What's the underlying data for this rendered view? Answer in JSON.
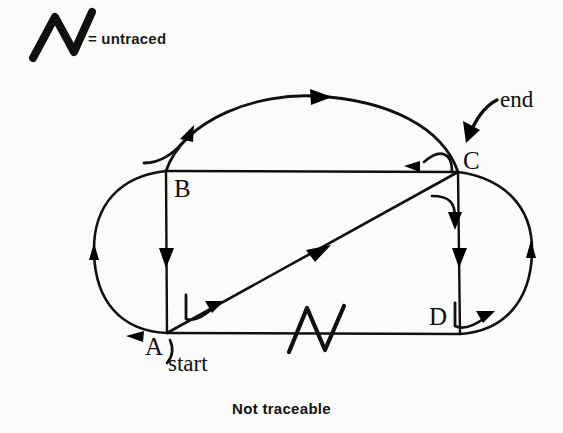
{
  "legend": {
    "symbol_name": "zigzag-untraced-mark",
    "equals_sign": "=",
    "text": "= untraced"
  },
  "caption": {
    "text": "Not traceable"
  },
  "diagram": {
    "vertices": [
      {
        "id": "A",
        "label": "A",
        "x": 167,
        "y": 333,
        "role": "start"
      },
      {
        "id": "B",
        "label": "B",
        "x": 166,
        "y": 171,
        "role": "corner"
      },
      {
        "id": "C",
        "label": "C",
        "x": 458,
        "y": 172,
        "role": "end"
      },
      {
        "id": "D",
        "label": "D",
        "x": 460,
        "y": 334,
        "role": "corner"
      }
    ],
    "annotations": [
      {
        "id": "start",
        "text": "start",
        "points_to": "A"
      },
      {
        "id": "end",
        "text": "end",
        "points_to": "C"
      }
    ],
    "edges": [
      {
        "id": "BC",
        "from": "B",
        "to": "C",
        "kind": "straight",
        "direction": "C-to-B",
        "traced": true
      },
      {
        "id": "BA",
        "from": "B",
        "to": "A",
        "kind": "straight",
        "direction": "B-to-A",
        "traced": true
      },
      {
        "id": "CD",
        "from": "C",
        "to": "D",
        "kind": "straight",
        "direction": "C-to-D",
        "traced": true
      },
      {
        "id": "AD",
        "from": "A",
        "to": "D",
        "kind": "straight",
        "direction": "none",
        "traced": false
      },
      {
        "id": "AC",
        "from": "A",
        "to": "C",
        "kind": "diagonal",
        "direction": "A-to-C",
        "traced": true
      },
      {
        "id": "B-arc-C",
        "from": "B",
        "to": "C",
        "kind": "outer-arc-top",
        "direction": "B-to-C",
        "traced": true
      },
      {
        "id": "A-arc-B",
        "from": "A",
        "to": "B",
        "kind": "outer-arc-left",
        "direction": "A-to-B",
        "traced": true
      },
      {
        "id": "D-arc-C",
        "from": "D",
        "to": "C",
        "kind": "outer-arc-right",
        "direction": "D-to-C",
        "traced": true
      }
    ],
    "untraced_marks": [
      {
        "on_edge": "AD",
        "x": 315,
        "y": 330
      }
    ],
    "colors": {
      "ink": "#101010",
      "background": "#fbfbfa"
    }
  }
}
